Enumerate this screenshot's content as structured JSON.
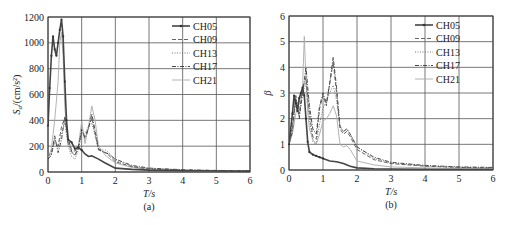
{
  "chart_data": [
    {
      "type": "line",
      "panel": "(a)",
      "title": "",
      "xlabel": "T/s",
      "ylabel": "Sa/(cm/s²)",
      "xlim": [
        0,
        6
      ],
      "ylim": [
        0,
        1200
      ],
      "xticks": [
        0,
        1,
        2,
        3,
        4,
        5,
        6
      ],
      "yticks": [
        0,
        200,
        400,
        600,
        800,
        1000,
        1200
      ],
      "grid": true,
      "legend_position": "upper right",
      "series": [
        {
          "name": "CH05",
          "style": "solid-marker",
          "x": [
            0,
            0.05,
            0.1,
            0.15,
            0.2,
            0.25,
            0.3,
            0.35,
            0.4,
            0.45,
            0.5,
            0.55,
            0.6,
            0.7,
            0.8,
            0.9,
            1.0,
            1.1,
            1.2,
            1.3,
            1.5,
            1.7,
            2.0,
            2.5,
            3,
            4,
            5,
            6
          ],
          "values": [
            360,
            650,
            900,
            1050,
            950,
            900,
            1000,
            1100,
            1180,
            1050,
            700,
            400,
            250,
            230,
            180,
            190,
            170,
            140,
            120,
            125,
            100,
            70,
            30,
            20,
            15,
            10,
            8,
            6
          ]
        },
        {
          "name": "CH09",
          "style": "dashed",
          "x": [
            0,
            0.1,
            0.2,
            0.3,
            0.4,
            0.5,
            0.6,
            0.7,
            0.8,
            0.9,
            1.0,
            1.1,
            1.2,
            1.3,
            1.4,
            1.5,
            1.6,
            1.7,
            1.8,
            2.0,
            2.5,
            3,
            4,
            5,
            6
          ],
          "values": [
            120,
            150,
            250,
            200,
            350,
            420,
            220,
            180,
            160,
            200,
            310,
            280,
            340,
            420,
            300,
            170,
            160,
            150,
            130,
            80,
            40,
            25,
            15,
            10,
            8
          ]
        },
        {
          "name": "CH13",
          "style": "dotted",
          "x": [
            0,
            0.1,
            0.2,
            0.3,
            0.4,
            0.5,
            0.6,
            0.7,
            0.8,
            0.9,
            1.0,
            1.1,
            1.2,
            1.3,
            1.4,
            1.5,
            1.6,
            1.7,
            1.8,
            2.0,
            2.5,
            3,
            4,
            5,
            6
          ],
          "values": [
            110,
            140,
            230,
            190,
            300,
            380,
            200,
            120,
            100,
            170,
            290,
            300,
            350,
            380,
            280,
            180,
            170,
            170,
            150,
            90,
            45,
            28,
            15,
            10,
            8
          ]
        },
        {
          "name": "CH17",
          "style": "dash-dot",
          "x": [
            0,
            0.1,
            0.2,
            0.3,
            0.4,
            0.5,
            0.6,
            0.7,
            0.8,
            0.9,
            1.0,
            1.1,
            1.2,
            1.3,
            1.4,
            1.5,
            1.6,
            1.7,
            1.8,
            2.0,
            2.5,
            3,
            4,
            5,
            6
          ],
          "values": [
            100,
            130,
            280,
            150,
            250,
            430,
            260,
            160,
            130,
            180,
            330,
            260,
            330,
            450,
            320,
            180,
            160,
            150,
            140,
            100,
            50,
            30,
            18,
            12,
            10
          ]
        },
        {
          "name": "CH21",
          "style": "solid-light",
          "x": [
            0,
            0.1,
            0.2,
            0.3,
            0.35,
            0.4,
            0.45,
            0.5,
            0.6,
            0.7,
            0.8,
            0.9,
            1.0,
            1.1,
            1.2,
            1.3,
            1.4,
            1.5,
            1.7,
            2.0,
            2.5,
            3,
            4,
            5,
            6
          ],
          "values": [
            110,
            180,
            400,
            700,
            1000,
            1080,
            900,
            500,
            220,
            150,
            130,
            200,
            390,
            220,
            350,
            510,
            400,
            200,
            130,
            70,
            35,
            20,
            12,
            8,
            6
          ]
        }
      ]
    },
    {
      "type": "line",
      "panel": "(b)",
      "title": "",
      "xlabel": "T/s",
      "ylabel": "β",
      "xlim": [
        0,
        6
      ],
      "ylim": [
        0,
        6
      ],
      "xticks": [
        0,
        1,
        2,
        3,
        4,
        5,
        6
      ],
      "yticks": [
        0,
        1,
        2,
        3,
        4,
        5,
        6
      ],
      "grid": true,
      "legend_position": "upper right",
      "series": [
        {
          "name": "CH05",
          "style": "solid-marker",
          "x": [
            0,
            0.1,
            0.15,
            0.2,
            0.25,
            0.3,
            0.35,
            0.4,
            0.45,
            0.5,
            0.55,
            0.6,
            0.7,
            0.8,
            0.9,
            1.0,
            1.2,
            1.4,
            1.6,
            1.8,
            2.0,
            2.5,
            3,
            4,
            5,
            6
          ],
          "values": [
            1.0,
            2.2,
            2.9,
            2.6,
            2.3,
            2.8,
            3.0,
            3.2,
            2.9,
            2.0,
            1.1,
            0.7,
            0.6,
            0.55,
            0.5,
            0.45,
            0.35,
            0.32,
            0.25,
            0.15,
            0.08,
            0.05,
            0.04,
            0.03,
            0.02,
            0.02
          ]
        },
        {
          "name": "CH09",
          "style": "dashed",
          "x": [
            0,
            0.1,
            0.2,
            0.3,
            0.4,
            0.5,
            0.6,
            0.7,
            0.8,
            0.9,
            1.0,
            1.1,
            1.2,
            1.3,
            1.4,
            1.5,
            1.6,
            1.7,
            1.8,
            2.0,
            2.5,
            3,
            4,
            5,
            6
          ],
          "values": [
            1.0,
            1.8,
            2.8,
            2.2,
            3.2,
            3.6,
            2.2,
            1.3,
            1.2,
            2.4,
            2.9,
            2.5,
            3.4,
            4.2,
            3.0,
            1.6,
            1.4,
            1.5,
            1.3,
            0.8,
            0.4,
            0.25,
            0.15,
            0.1,
            0.08
          ]
        },
        {
          "name": "CH13",
          "style": "dotted",
          "x": [
            0,
            0.1,
            0.2,
            0.3,
            0.4,
            0.5,
            0.6,
            0.7,
            0.8,
            0.9,
            1.0,
            1.1,
            1.2,
            1.3,
            1.4,
            1.5,
            1.6,
            1.7,
            1.8,
            2.0,
            2.5,
            3,
            4,
            5,
            6
          ],
          "values": [
            1.0,
            1.6,
            2.6,
            2.1,
            3.0,
            3.4,
            2.0,
            1.1,
            1.0,
            1.8,
            2.4,
            2.7,
            3.0,
            3.3,
            2.7,
            1.7,
            1.5,
            1.6,
            1.4,
            0.9,
            0.45,
            0.28,
            0.16,
            0.1,
            0.08
          ]
        },
        {
          "name": "CH17",
          "style": "dash-dot",
          "x": [
            0,
            0.1,
            0.2,
            0.3,
            0.4,
            0.5,
            0.6,
            0.7,
            0.8,
            0.9,
            1.0,
            1.1,
            1.2,
            1.3,
            1.4,
            1.5,
            1.6,
            1.7,
            1.8,
            2.0,
            2.5,
            3,
            4,
            5,
            6
          ],
          "values": [
            1.0,
            1.5,
            2.9,
            2.0,
            3.0,
            4.0,
            2.5,
            1.6,
            1.4,
            2.5,
            3.0,
            2.6,
            3.4,
            4.4,
            3.2,
            1.7,
            1.5,
            1.6,
            1.4,
            0.9,
            0.5,
            0.3,
            0.18,
            0.12,
            0.1
          ]
        },
        {
          "name": "CH21",
          "style": "solid-light",
          "x": [
            0,
            0.1,
            0.2,
            0.3,
            0.4,
            0.45,
            0.5,
            0.55,
            0.6,
            0.7,
            0.8,
            0.9,
            1.0,
            1.1,
            1.2,
            1.3,
            1.4,
            1.5,
            1.6,
            1.7,
            1.8,
            2.0,
            2.5,
            3,
            4,
            5,
            6
          ],
          "values": [
            1.0,
            1.4,
            2.2,
            2.6,
            3.3,
            5.2,
            3.5,
            2.3,
            1.6,
            1.2,
            1.0,
            1.4,
            1.9,
            2.0,
            2.2,
            2.5,
            2.1,
            1.0,
            0.9,
            0.95,
            0.8,
            0.35,
            0.2,
            0.12,
            0.08,
            0.06,
            0.05
          ]
        }
      ]
    }
  ],
  "panels": [
    {
      "caption": "(a)",
      "xlabel": "T/s",
      "ylabel_main": "S",
      "ylabel_sub": "a",
      "ylabel_rest": "/(cm/s²)"
    },
    {
      "caption": "(b)",
      "xlabel": "T/s",
      "ylabel_main": "β"
    }
  ],
  "legend": [
    "CH05",
    "CH09",
    "CH13",
    "CH17",
    "CH21"
  ]
}
